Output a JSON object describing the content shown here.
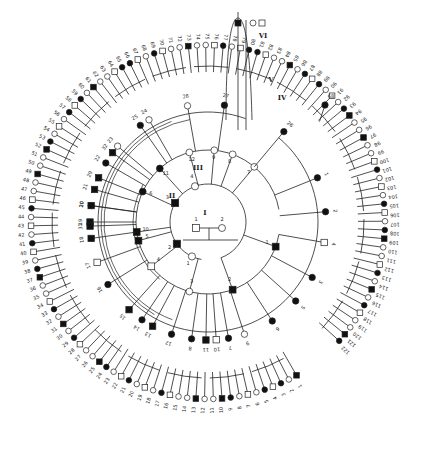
{
  "diagram": {
    "type": "circular-pedigree",
    "center": {
      "x": 208,
      "y": 222
    },
    "colors": {
      "ink": "#222222",
      "paper": "#ffffff",
      "affected": "#111111",
      "unaffected": "#ffffff"
    },
    "generation_labels": [
      {
        "text": "I",
        "x": 205,
        "y": 215
      },
      {
        "text": "II",
        "x": 172,
        "y": 198
      },
      {
        "text": "III",
        "x": 198,
        "y": 170
      },
      {
        "text": "IV",
        "x": 282,
        "y": 100
      },
      {
        "text": "V",
        "x": 271,
        "y": 82
      },
      {
        "text": "VI",
        "x": 263,
        "y": 38
      }
    ],
    "founders": [
      {
        "id": "I-1",
        "sex": "male",
        "affected": false,
        "x": 196,
        "y": 228,
        "label": "1"
      },
      {
        "id": "I-2",
        "sex": "female",
        "affected": false,
        "x": 222,
        "y": 228,
        "label": "2"
      }
    ],
    "rings": [
      {
        "name": "generation-II",
        "radius": 38
      },
      {
        "name": "generation-III",
        "radius": 72
      },
      {
        "name": "generation-IV",
        "radius": 110
      },
      {
        "name": "generation-V",
        "radius": 150
      },
      {
        "name": "generation-VI",
        "radius": 185
      }
    ],
    "gen2": [
      {
        "label": "1",
        "sex": "female",
        "affected": false,
        "angle": 205
      },
      {
        "label": "2",
        "sex": "male",
        "affected": true,
        "angle": 235
      },
      {
        "label": "3",
        "sex": "male",
        "affected": true,
        "angle": 300
      },
      {
        "label": "4",
        "sex": "female",
        "affected": false,
        "angle": 340
      }
    ],
    "gen3": [
      {
        "label": "1",
        "sex": "male",
        "affected": true,
        "angle": 110
      },
      {
        "label": "2",
        "sex": "male",
        "affected": true,
        "angle": 160
      },
      {
        "label": "3",
        "sex": "female",
        "affected": false,
        "angle": 195
      },
      {
        "label": "4",
        "sex": "male",
        "affected": false,
        "angle": 232
      },
      {
        "label": "5",
        "sex": "male",
        "affected": true,
        "angle": 255
      },
      {
        "label": "6",
        "sex": "female",
        "affected": true,
        "angle": 295
      },
      {
        "label": "7",
        "sex": "female",
        "affected": false,
        "angle": 40
      },
      {
        "label": "8",
        "sex": "female",
        "affected": false,
        "angle": 20
      },
      {
        "label": "9",
        "sex": "female",
        "affected": false,
        "angle": 5
      },
      {
        "label": "10",
        "sex": "male",
        "affected": true,
        "angle": 262
      },
      {
        "label": "11",
        "sex": "female",
        "affected": true,
        "angle": 318
      },
      {
        "label": "12",
        "sex": "female",
        "affected": false,
        "angle": 345
      }
    ],
    "gen4": [
      {
        "label": "1",
        "sex": "female",
        "affected": true,
        "angle": 68
      },
      {
        "label": "2",
        "sex": "female",
        "affected": true,
        "angle": 85
      },
      {
        "label": "3",
        "sex": "female",
        "affected": true,
        "angle": 118
      },
      {
        "label": "4",
        "sex": "male",
        "affected": false,
        "angle": 100
      },
      {
        "label": "5",
        "sex": "female",
        "affected": true,
        "angle": 132
      },
      {
        "label": "6",
        "sex": "female",
        "affected": true,
        "angle": 147
      },
      {
        "label": "7",
        "sex": "female",
        "affected": true,
        "angle": 170
      },
      {
        "label": "8",
        "sex": "female",
        "affected": true,
        "angle": 188
      },
      {
        "label": "9",
        "sex": "female",
        "affected": false,
        "angle": 162
      },
      {
        "label": "10",
        "sex": "male",
        "affected": false,
        "angle": 176
      },
      {
        "label": "11",
        "sex": "male",
        "affected": true,
        "angle": 181
      },
      {
        "label": "12",
        "sex": "female",
        "affected": true,
        "angle": 198
      },
      {
        "label": "13",
        "sex": "male",
        "affected": true,
        "angle": 208
      },
      {
        "label": "14",
        "sex": "female",
        "affected": true,
        "angle": 214
      },
      {
        "label": "15",
        "sex": "male",
        "affected": true,
        "angle": 222
      },
      {
        "label": "16",
        "sex": "female",
        "affected": true,
        "angle": 238
      },
      {
        "label": "17",
        "sex": "male",
        "affected": false,
        "angle": 250
      },
      {
        "label": "18",
        "sex": "male",
        "affected": true,
        "angle": 262
      },
      {
        "label": "19",
        "sex": "male",
        "affected": true,
        "angle": 270
      },
      {
        "label": "20",
        "sex": "female",
        "affected": false,
        "angle": 278
      },
      {
        "label": "21",
        "sex": "male",
        "affected": true,
        "angle": 286
      },
      {
        "label": "22",
        "sex": "female",
        "affected": true,
        "angle": 300
      },
      {
        "label": "23",
        "sex": "female",
        "affected": false,
        "angle": 310
      },
      {
        "label": "24",
        "sex": "female",
        "affected": false,
        "angle": 330
      },
      {
        "label": "25",
        "sex": "female",
        "affected": true,
        "angle": 325
      },
      {
        "label": "26",
        "sex": "female",
        "affected": true,
        "angle": 40
      },
      {
        "label": "27",
        "sex": "female",
        "affected": true,
        "angle": 8
      },
      {
        "label": "28",
        "sex": "female",
        "affected": false,
        "angle": 350
      },
      {
        "label": "29",
        "sex": "male",
        "affected": true,
        "angle": 292
      },
      {
        "label": "30",
        "sex": "male",
        "affected": true,
        "angle": 278
      },
      {
        "label": "31",
        "sex": "male",
        "affected": true,
        "angle": 268
      },
      {
        "label": "32",
        "sex": "male",
        "affected": true,
        "angle": 306
      }
    ],
    "outer_row_labels_visible": [
      "1",
      "2",
      "3",
      "4",
      "5",
      "6",
      "7",
      "8",
      "9",
      "10",
      "11",
      "12",
      "13",
      "14",
      "15",
      "16",
      "17",
      "18",
      "19",
      "20",
      "21",
      "22",
      "23",
      "24",
      "25",
      "26",
      "27",
      "28",
      "29",
      "30",
      "31",
      "32",
      "33",
      "34",
      "35",
      "36",
      "37",
      "38",
      "39",
      "40",
      "41",
      "42",
      "43",
      "44",
      "45",
      "46",
      "47",
      "48",
      "49",
      "50",
      "51",
      "52",
      "53",
      "54",
      "55",
      "56",
      "57",
      "58",
      "59",
      "60",
      "61",
      "62",
      "63",
      "64",
      "65",
      "66",
      "67",
      "68",
      "69",
      "70",
      "71",
      "72",
      "73",
      "74",
      "75",
      "76",
      "77",
      "78",
      "79",
      "80",
      "81",
      "82",
      "83",
      "84",
      "85",
      "86",
      "87",
      "88",
      "89",
      "90",
      "91",
      "92",
      "93",
      "94",
      "95",
      "96",
      "97",
      "98",
      "99",
      "100",
      "101",
      "102",
      "103",
      "104",
      "105",
      "106",
      "107",
      "108",
      "109",
      "110",
      "111",
      "112",
      "113",
      "114",
      "115",
      "116",
      "117",
      "118",
      "119",
      "120",
      "121",
      "122"
    ]
  }
}
